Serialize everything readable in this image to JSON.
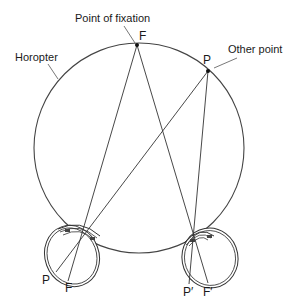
{
  "diagram": {
    "labels": {
      "fixation_caption": "Point of fixation",
      "other_caption": "Other point",
      "horopter_caption": "Horopter",
      "fixation_point": "F",
      "other_point": "P",
      "left_retina_P": "P",
      "left_retina_F": "F",
      "right_retina_P": "P′",
      "right_retina_F": "F′"
    },
    "colors": {
      "stroke": "#333333",
      "text": "#1a1a1a",
      "background": "#ffffff"
    }
  }
}
